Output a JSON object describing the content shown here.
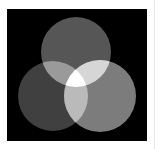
{
  "diagram": {
    "type": "venn-3-circles",
    "background": "#000000",
    "page_background": "#ffffff",
    "circles": [
      {
        "name": "top",
        "cx": 69,
        "cy": 43,
        "r": 35,
        "fill": "#565656"
      },
      {
        "name": "left",
        "cx": 46,
        "cy": 87,
        "r": 35,
        "fill": "#404040"
      },
      {
        "name": "right",
        "cx": 93,
        "cy": 87,
        "r": 36,
        "fill": "#7c7c7c"
      }
    ],
    "overlaps": {
      "top_left": "#9a9a9a",
      "top_right": "#d6d6d6",
      "left_right": "#bababa",
      "all_three": "#ffffff"
    }
  }
}
